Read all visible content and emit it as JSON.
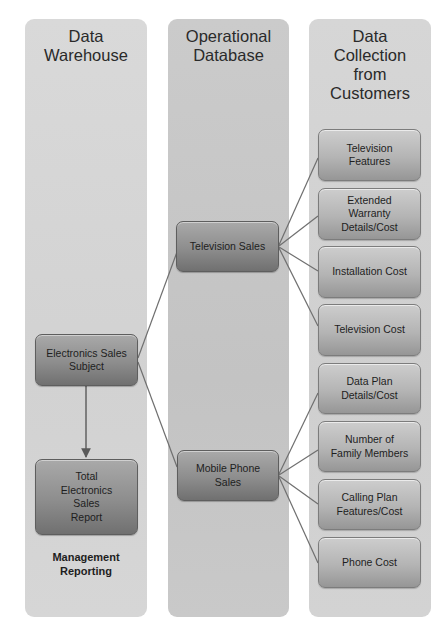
{
  "columns": {
    "left": {
      "title": "Data Warehouse",
      "title_lines": [
        "Data",
        "Warehouse"
      ]
    },
    "middle": {
      "title": "Operational Database",
      "title_lines": [
        "Operational",
        "Database"
      ]
    },
    "right": {
      "title": "Data Collection from Customers",
      "title_lines": [
        "Data",
        "Collection",
        "from",
        "Customers"
      ]
    }
  },
  "left_nodes": {
    "subject": {
      "label": "Electronics Sales Subject",
      "lines": [
        "Electronics Sales",
        "Subject"
      ]
    },
    "report": {
      "label": "Total Electronics Sales Report",
      "lines": [
        "Total",
        "Electronics",
        "Sales",
        "Report"
      ]
    },
    "caption": {
      "label": "Management Reporting",
      "lines": [
        "Management",
        "Reporting"
      ]
    }
  },
  "middle_nodes": {
    "tv": {
      "label": "Television Sales",
      "lines": [
        "Television Sales"
      ]
    },
    "mobile": {
      "label": "Mobile Phone Sales",
      "lines": [
        "Mobile Phone",
        "Sales"
      ]
    }
  },
  "right_nodes": [
    {
      "label": "Television Features",
      "lines": [
        "Television",
        "Features"
      ],
      "parent": "Television Sales"
    },
    {
      "label": "Extended Warranty Details/Cost",
      "lines": [
        "Extended",
        "Warranty",
        "Details/Cost"
      ],
      "parent": "Television Sales"
    },
    {
      "label": "Installation Cost",
      "lines": [
        "Installation Cost"
      ],
      "parent": "Television Sales"
    },
    {
      "label": "Television Cost",
      "lines": [
        "Television Cost"
      ],
      "parent": "Television Sales"
    },
    {
      "label": "Data Plan Details/Cost",
      "lines": [
        "Data Plan",
        "Details/Cost"
      ],
      "parent": "Mobile Phone Sales"
    },
    {
      "label": "Number of Family Members",
      "lines": [
        "Number of",
        "Family Members"
      ],
      "parent": "Mobile Phone Sales"
    },
    {
      "label": "Calling Plan Features/Cost",
      "lines": [
        "Calling Plan",
        "Features/Cost"
      ],
      "parent": "Mobile Phone Sales"
    },
    {
      "label": "Phone Cost",
      "lines": [
        "Phone Cost"
      ],
      "parent": "Mobile Phone Sales"
    }
  ],
  "edges": [
    {
      "from": "Electronics Sales Subject",
      "to": "Total Electronics Sales Report",
      "type": "arrow"
    },
    {
      "from": "Electronics Sales Subject",
      "to": "Television Sales",
      "type": "line"
    },
    {
      "from": "Electronics Sales Subject",
      "to": "Mobile Phone Sales",
      "type": "line"
    }
  ],
  "colors": {
    "line": "#6f6f6f",
    "column_side": "#d4d4d4",
    "column_middle": "#c6c6c6",
    "box_dark_top": "#a9a9a9",
    "box_dark_bottom": "#707070",
    "box_light_top": "#cdcdcd",
    "box_light_bottom": "#969696"
  }
}
